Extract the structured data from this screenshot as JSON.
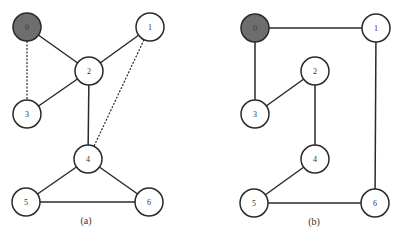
{
  "style": {
    "stroke": "#2a2a2a",
    "node_fill": "#ffffff",
    "root_fill": "#6e6e6e",
    "node_radius": 14,
    "text_color": "#333333"
  },
  "graphs": [
    {
      "id": "a",
      "caption": "(a)",
      "caption_pos": [
        86,
        224
      ],
      "nodes": [
        {
          "id": "0",
          "label": "0",
          "x": 27,
          "y": 27,
          "root": true
        },
        {
          "id": "1",
          "label": "1",
          "x": 150,
          "y": 27,
          "root": false
        },
        {
          "id": "2",
          "label": "2",
          "x": 89,
          "y": 71,
          "root": false
        },
        {
          "id": "3",
          "label": "3",
          "x": 27,
          "y": 114,
          "root": false
        },
        {
          "id": "4",
          "label": "4",
          "x": 88,
          "y": 159,
          "root": false
        },
        {
          "id": "5",
          "label": "5",
          "x": 26,
          "y": 202,
          "root": false
        },
        {
          "id": "6",
          "label": "6",
          "x": 149,
          "y": 202,
          "root": false
        }
      ],
      "edges": [
        {
          "from": "0",
          "to": "2",
          "dashed": false
        },
        {
          "from": "0",
          "to": "3",
          "dashed": true
        },
        {
          "from": "1",
          "to": "2",
          "dashed": false
        },
        {
          "from": "1",
          "to": "4",
          "dashed": true
        },
        {
          "from": "2",
          "to": "3",
          "dashed": false
        },
        {
          "from": "2",
          "to": "4",
          "dashed": false
        },
        {
          "from": "4",
          "to": "5",
          "dashed": false
        },
        {
          "from": "4",
          "to": "6",
          "dashed": false
        },
        {
          "from": "5",
          "to": "6",
          "dashed": false
        }
      ]
    },
    {
      "id": "b",
      "caption": "(b)",
      "caption_pos": [
        314,
        225
      ],
      "nodes": [
        {
          "id": "0",
          "label": "0",
          "x": 255,
          "y": 28,
          "root": true
        },
        {
          "id": "1",
          "label": "1",
          "x": 376,
          "y": 28,
          "root": false
        },
        {
          "id": "2",
          "label": "2",
          "x": 315,
          "y": 71,
          "root": false
        },
        {
          "id": "3",
          "label": "3",
          "x": 255,
          "y": 114,
          "root": false
        },
        {
          "id": "4",
          "label": "4",
          "x": 315,
          "y": 159,
          "root": false
        },
        {
          "id": "5",
          "label": "5",
          "x": 254,
          "y": 203,
          "root": false
        },
        {
          "id": "6",
          "label": "6",
          "x": 375,
          "y": 203,
          "root": false
        }
      ],
      "edges": [
        {
          "from": "0",
          "to": "1",
          "dashed": false
        },
        {
          "from": "0",
          "to": "3",
          "dashed": false
        },
        {
          "from": "2",
          "to": "3",
          "dashed": false
        },
        {
          "from": "2",
          "to": "4",
          "dashed": false
        },
        {
          "from": "4",
          "to": "5",
          "dashed": false
        },
        {
          "from": "1",
          "to": "6",
          "dashed": false
        },
        {
          "from": "5",
          "to": "6",
          "dashed": false
        }
      ]
    }
  ]
}
